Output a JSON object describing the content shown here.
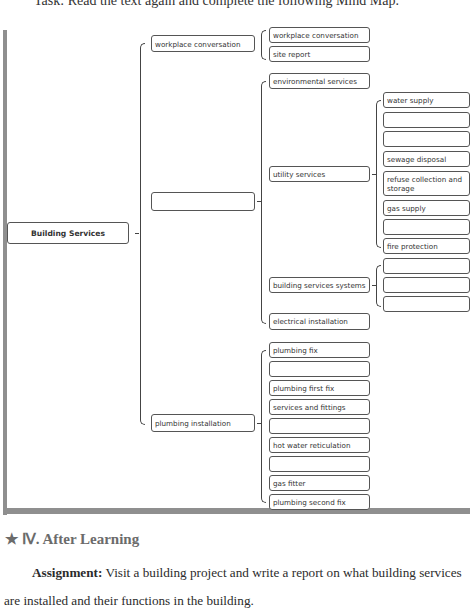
{
  "instruction_line": "Task: Read the text again and complete the following Mind Map.",
  "mind_map": {
    "root": "Building Services",
    "level1": [
      {
        "label": "workplace conversation",
        "children": [
          "workplace conversation",
          "site report"
        ]
      },
      {
        "label": "",
        "children": [
          {
            "label": "environmental services"
          },
          {
            "label": "utility services",
            "children": [
              "water supply",
              "",
              "",
              "sewage disposal",
              "refuse collection and storage",
              "gas supply",
              "",
              "fire protection"
            ]
          },
          {
            "label": "building services systems",
            "children": [
              "",
              "",
              ""
            ]
          },
          {
            "label": "electrical installation"
          }
        ]
      },
      {
        "label": "plumbing installation",
        "children": [
          "plumbing fix",
          "",
          "plumbing first fix",
          "services and fittings",
          "",
          "hot water reticulation",
          "",
          "gas fitter",
          "plumbing second fix"
        ]
      }
    ]
  },
  "section": {
    "star": "★",
    "heading": "Ⅳ. After Learning",
    "assignment_label": "Assignment:",
    "assignment_text": " Visit a building project and write a report on what building services are installed and their functions in the building."
  }
}
